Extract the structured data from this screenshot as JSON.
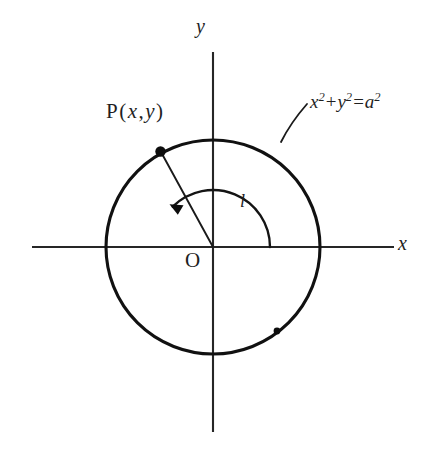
{
  "figure": {
    "background_color": "#ffffff",
    "ink_color": "#1a1a1a",
    "width": 431,
    "height": 455
  },
  "axes": {
    "x_label": "x",
    "y_label": "y",
    "origin_label": "O",
    "x_start": 32,
    "x_end": 394,
    "y_start": 52,
    "y_end": 432,
    "origin_x": 213,
    "origin_y": 247
  },
  "circle": {
    "center_x": 213,
    "center_y": 247,
    "radius": 107,
    "equation_label": {
      "lhs_x": "x",
      "lhs_x_exp": "2",
      "plus": "+",
      "lhs_y": "y",
      "lhs_y_exp": "2",
      "equals": "=",
      "rhs_a": "a",
      "rhs_a_exp": "2",
      "plain": "x² + y² = a²"
    }
  },
  "point_p": {
    "label_prefix": "P",
    "open_paren": "(",
    "coord_x": "x",
    "comma": ",",
    "coord_y": "y",
    "close_paren": ")",
    "plain": "P ( x, y )",
    "px": 160,
    "py": 151,
    "angle_degrees": 135
  },
  "arc_marker": {
    "label": "l",
    "description": "arc-length-parameter",
    "arrow_direction": "counterclockwise",
    "arc_radius": 57,
    "arc_start_degrees": 0,
    "arc_end_degrees": 135
  },
  "secondary_dot": {
    "x": 277,
    "y": 331,
    "description": "marker dot on lower-right arc"
  }
}
